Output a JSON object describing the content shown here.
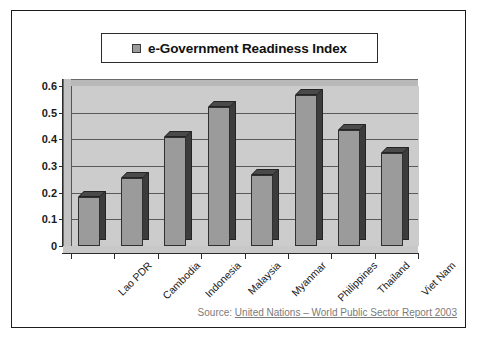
{
  "legend": {
    "label": "e-Government Readiness Index",
    "marker_color": "#9b9b9b"
  },
  "source": {
    "prefix": "Source:",
    "link_text": "United Nations – World Public Sector Report 2003",
    "color": "#7b7b7b"
  },
  "chart_data": {
    "type": "bar",
    "title": "e-Government Readiness Index",
    "xlabel": "",
    "ylabel": "",
    "ylim": [
      0,
      0.6
    ],
    "grid": true,
    "legend_position": "top",
    "yticks": [
      "0",
      "0.1",
      "0.2",
      "0.3",
      "0.4",
      "0.5",
      "0.6"
    ],
    "ytick_values": [
      0,
      0.1,
      0.2,
      0.3,
      0.4,
      0.5,
      0.6
    ],
    "categories": [
      "Lao PDR",
      "Cambodia",
      "Indonesia",
      "Malaysia",
      "Myanmar",
      "Philippines",
      "Thailand",
      "Viet Nam"
    ],
    "series": [
      {
        "name": "e-Government Readiness Index",
        "values": [
          0.185,
          0.255,
          0.41,
          0.52,
          0.265,
          0.565,
          0.435,
          0.35
        ]
      }
    ],
    "bar_face_color": "#9b9b9b",
    "bar_shade_color": "#3c3c3c",
    "plot_background": "#cccccc"
  }
}
